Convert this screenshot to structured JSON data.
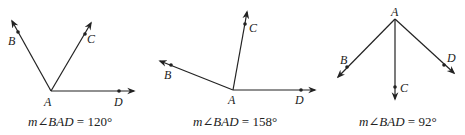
{
  "figures": [
    {
      "vertex": "A",
      "rays": [
        "B",
        "C",
        "D"
      ],
      "caption": {
        "prefix": "m∠",
        "angle": "BAD",
        "equals": " = ",
        "value": "120°"
      },
      "measure_deg": 120
    },
    {
      "vertex": "A",
      "rays": [
        "B",
        "C",
        "D"
      ],
      "caption": {
        "prefix": "m∠",
        "angle": "BAD",
        "equals": " = ",
        "value": "158°"
      },
      "measure_deg": 158
    },
    {
      "vertex": "A",
      "rays": [
        "B",
        "C",
        "D"
      ],
      "caption": {
        "prefix": "m∠",
        "angle": "BAD",
        "equals": " = ",
        "value": "92°"
      },
      "measure_deg": 92
    }
  ],
  "colors": {
    "line": "#222222",
    "background": "#ffffff"
  }
}
